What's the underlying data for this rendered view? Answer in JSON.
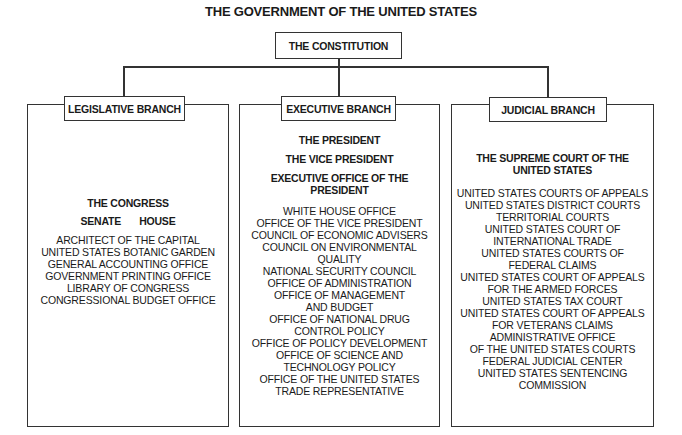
{
  "title": "THE GOVERNMENT OF THE UNITED STATES",
  "root": {
    "label": "THE CONSTITUTION"
  },
  "branches": {
    "legislative": {
      "label": "LEGISLATIVE BRANCH",
      "heading": "THE CONGRESS",
      "chambers": [
        "SENATE",
        "HOUSE"
      ],
      "items": [
        "ARCHITECT OF THE CAPITAL",
        "UNITED STATES BOTANIC GARDEN",
        "GENERAL ACCOUNTING OFFICE",
        "GOVERNMENT PRINTING OFFICE",
        "LIBRARY OF CONGRESS",
        "CONGRESSIONAL BUDGET OFFICE"
      ]
    },
    "executive": {
      "label": "EXECUTIVE BRANCH",
      "headings": [
        "THE PRESIDENT",
        "THE VICE PRESIDENT",
        "EXECUTIVE OFFICE OF THE",
        "PRESIDENT"
      ],
      "items": [
        "WHITE HOUSE OFFICE",
        "OFFICE OF THE VICE PRESIDENT",
        "COUNCIL OF ECONOMIC ADVISERS",
        "COUNCIL ON ENVIRONMENTAL",
        "QUALITY",
        "NATIONAL SECURITY COUNCIL",
        "OFFICE OF ADMINISTRATION",
        "OFFICE OF MANAGEMENT",
        "AND BUDGET",
        "OFFICE OF NATIONAL DRUG",
        "CONTROL POLICY",
        "OFFICE OF POLICY DEVELOPMENT",
        "OFFICE OF SCIENCE AND",
        "TECHNOLOGY POLICY",
        "OFFICE OF THE UNITED STATES",
        "TRADE REPRESENTATIVE"
      ]
    },
    "judicial": {
      "label": "JUDICIAL BRANCH",
      "headings": [
        "THE SUPREME COURT OF THE",
        "UNITED STATES"
      ],
      "items": [
        "UNITED STATES COURTS OF APPEALS",
        "UNITED STATES DISTRICT COURTS",
        "TERRITORIAL COURTS",
        "UNITED STATES COURT OF",
        "INTERNATIONAL TRADE",
        "UNITED STATES COURTS OF",
        "FEDERAL CLAIMS",
        "UNITED STATES COURT OF APPEALS",
        "FOR THE ARMED FORCES",
        "UNITED STATES TAX COURT",
        "UNITED STATES COURT OF APPEALS",
        "FOR VETERANS CLAIMS",
        "ADMINISTRATIVE OFFICE",
        "OF THE UNITED STATES COURTS",
        "FEDERAL JUDICIAL CENTER",
        "UNITED STATES SENTENCING",
        "COMMISSION"
      ]
    }
  },
  "colors": {
    "line": "#333333",
    "text": "#1a1a1a",
    "background": "#ffffff"
  }
}
